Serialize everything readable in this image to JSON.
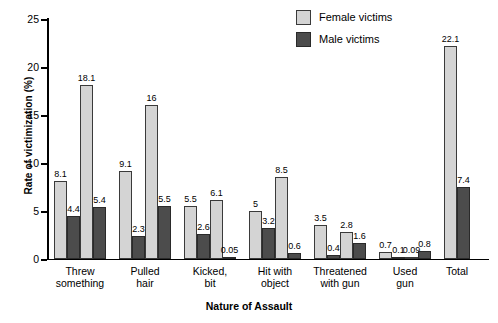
{
  "chart_data": {
    "type": "bar",
    "title": "",
    "xlabel": "Nature of Assault",
    "ylabel": "Rate of victimization (%)",
    "ylim": [
      0,
      25
    ],
    "yticks": [
      0,
      5,
      10,
      15,
      20,
      25
    ],
    "ytick_labels": [
      "0",
      "5",
      "10",
      "15",
      "20",
      "25"
    ],
    "grid": false,
    "legend_position": "top-right",
    "legend": [
      {
        "name": "Female victims",
        "color": "#d4d4d4"
      },
      {
        "name": "Male victims",
        "color": "#4c4c4c"
      }
    ],
    "categories": [
      "Threw\nsomething",
      "Pulled\nhair",
      "Kicked,\nbit",
      "Hit with\nobject",
      "Threatened\nwith gun",
      "Used\ngun",
      "Total"
    ],
    "bars": [
      {
        "group": "Threw\nsomething",
        "series": "Female victims",
        "value": 8.1,
        "label": "8.1"
      },
      {
        "group": "Threw\nsomething",
        "series": "Male victims",
        "value": 4.4,
        "label": "4.4"
      },
      {
        "group": "Threw\nsomething",
        "series": "Female victims",
        "value": 18.1,
        "label": "18.1"
      },
      {
        "group": "Threw\nsomething",
        "series": "Male victims",
        "value": 5.4,
        "label": "5.4"
      },
      {
        "group": "Pulled\nhair",
        "series": "Female victims",
        "value": 9.1,
        "label": "9.1"
      },
      {
        "group": "Pulled\nhair",
        "series": "Male victims",
        "value": 2.3,
        "label": "2.3"
      },
      {
        "group": "Pulled\nhair",
        "series": "Female victims",
        "value": 16,
        "label": "16"
      },
      {
        "group": "Pulled\nhair",
        "series": "Male victims",
        "value": 5.5,
        "label": "5.5"
      },
      {
        "group": "Kicked,\nbit",
        "series": "Female victims",
        "value": 5.5,
        "label": "5.5"
      },
      {
        "group": "Kicked,\nbit",
        "series": "Male victims",
        "value": 2.6,
        "label": "2.6"
      },
      {
        "group": "Kicked,\nbit",
        "series": "Female victims",
        "value": 6.1,
        "label": "6.1"
      },
      {
        "group": "Kicked,\nbit",
        "series": "Male victims",
        "value": 0.05,
        "label": "0.05"
      },
      {
        "group": "Hit with\nobject",
        "series": "Female victims",
        "value": 5,
        "label": "5"
      },
      {
        "group": "Hit with\nobject",
        "series": "Male victims",
        "value": 3.2,
        "label": "3.2"
      },
      {
        "group": "Hit with\nobject",
        "series": "Female victims",
        "value": 8.5,
        "label": "8.5"
      },
      {
        "group": "Hit with\nobject",
        "series": "Male victims",
        "value": 0.6,
        "label": "0.6"
      },
      {
        "group": "Threatened\nwith gun",
        "series": "Female victims",
        "value": 3.5,
        "label": "3.5"
      },
      {
        "group": "Threatened\nwith gun",
        "series": "Male victims",
        "value": 0.4,
        "label": "0.4"
      },
      {
        "group": "Threatened\nwith gun",
        "series": "Female victims",
        "value": 2.8,
        "label": "2.8"
      },
      {
        "group": "Threatened\nwith gun",
        "series": "Male victims",
        "value": 1.6,
        "label": "1.6"
      },
      {
        "group": "Used\ngun",
        "series": "Female victims",
        "value": 0.7,
        "label": "0.7"
      },
      {
        "group": "Used\ngun",
        "series": "Male victims",
        "value": 0.1,
        "label": "0.1"
      },
      {
        "group": "Used\ngun",
        "series": "Female victims",
        "value": 0.09,
        "label": "0.09"
      },
      {
        "group": "Used\ngun",
        "series": "Male victims",
        "value": 0.8,
        "label": "0.8"
      },
      {
        "group": "Total",
        "series": "Female victims",
        "value": 22.1,
        "label": "22.1"
      },
      {
        "group": "Total",
        "series": "Male victims",
        "value": 7.4,
        "label": "7.4"
      }
    ]
  }
}
